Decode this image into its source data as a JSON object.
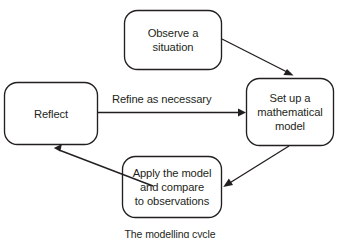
{
  "diagram": {
    "caption": "The modelling cycle",
    "stroke_color": "#231f20",
    "background_color": "#ffffff",
    "nodes": [
      {
        "id": "observe",
        "lines": [
          "Observe a",
          "situation"
        ],
        "line1": "Observe a",
        "line2": "situation",
        "shape": "rounded-rectangle",
        "x": 124,
        "y": 10,
        "width": 98,
        "height": 60
      },
      {
        "id": "model",
        "lines": [
          "Set up a",
          "mathematical",
          "model"
        ],
        "line1": "Set up a",
        "line2": "mathematical",
        "line3": "model",
        "shape": "rounded-rectangle",
        "x": 246,
        "y": 78,
        "width": 88,
        "height": 68
      },
      {
        "id": "apply",
        "lines": [
          "Apply the model",
          "and compare",
          "to observations"
        ],
        "line1": "Apply the model",
        "line2": "and compare",
        "line3": "to observations",
        "shape": "rounded-rectangle",
        "x": 122,
        "y": 156,
        "width": 100,
        "height": 62
      },
      {
        "id": "reflect",
        "lines": [
          "Reflect"
        ],
        "line1": "Reflect",
        "shape": "rounded-rectangle",
        "x": 4,
        "y": 82,
        "width": 94,
        "height": 63
      }
    ],
    "edges": [
      {
        "id": "observe-to-model",
        "from": "observe",
        "to": "model",
        "label": "",
        "direction": "diagonal-down-right"
      },
      {
        "id": "model-to-apply",
        "from": "model",
        "to": "apply",
        "label": "",
        "direction": "diagonal-down-left"
      },
      {
        "id": "apply-to-reflect",
        "from": "apply",
        "to": "reflect",
        "label": "",
        "direction": "diagonal-up-left"
      },
      {
        "id": "reflect-to-model",
        "from": "reflect",
        "to": "model",
        "label": "Refine as necessary",
        "direction": "horizontal-right"
      }
    ]
  }
}
